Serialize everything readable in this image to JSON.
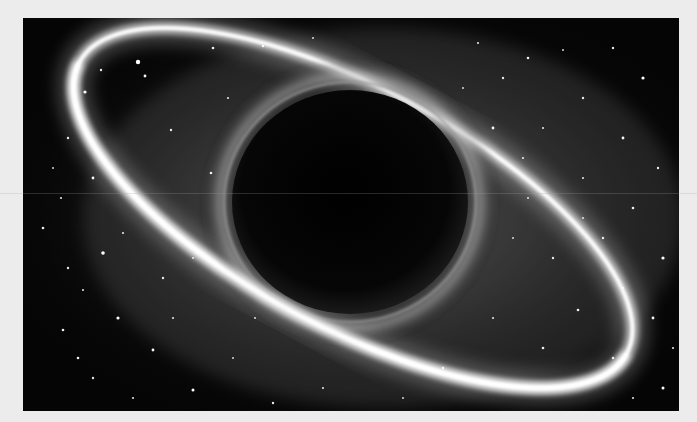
{
  "image": {
    "subject": "black hole with glowing accretion ring in a starfield",
    "palette": {
      "background_frame": "#ececec",
      "space": "#050505",
      "ring_glow": "#ffffff",
      "haze": "#9a9a9a",
      "event_horizon": "#000000"
    },
    "black_hole": {
      "cx": 327,
      "cy": 184,
      "rx": 118,
      "ry": 112
    },
    "stars": [
      [
        115,
        44,
        2.2
      ],
      [
        122,
        58,
        1.4
      ],
      [
        190,
        30,
        1.3
      ],
      [
        78,
        52,
        1.2
      ],
      [
        62,
        74,
        1.6
      ],
      [
        45,
        120,
        1.2
      ],
      [
        70,
        160,
        1.4
      ],
      [
        38,
        180,
        1.1
      ],
      [
        20,
        210,
        1.3
      ],
      [
        80,
        235,
        1.8
      ],
      [
        45,
        250,
        1.2
      ],
      [
        60,
        272,
        1.1
      ],
      [
        40,
        312,
        1.3
      ],
      [
        95,
        300,
        1.6
      ],
      [
        70,
        360,
        1.2
      ],
      [
        130,
        332,
        1.4
      ],
      [
        110,
        380,
        1.1
      ],
      [
        170,
        372,
        1.5
      ],
      [
        188,
        155,
        1.3
      ],
      [
        148,
        112,
        1.2
      ],
      [
        205,
        80,
        1.1
      ],
      [
        240,
        28,
        1.2
      ],
      [
        290,
        20,
        1.0
      ],
      [
        455,
        25,
        1.1
      ],
      [
        505,
        40,
        1.3
      ],
      [
        540,
        32,
        1.0
      ],
      [
        590,
        30,
        1.2
      ],
      [
        620,
        60,
        1.6
      ],
      [
        560,
        80,
        1.2
      ],
      [
        520,
        110,
        1.1
      ],
      [
        600,
        120,
        1.4
      ],
      [
        635,
        150,
        1.2
      ],
      [
        560,
        160,
        1.1
      ],
      [
        505,
        180,
        1.0
      ],
      [
        610,
        190,
        1.3
      ],
      [
        580,
        220,
        1.2
      ],
      [
        640,
        240,
        1.6
      ],
      [
        600,
        270,
        1.1
      ],
      [
        555,
        292,
        1.3
      ],
      [
        630,
        300,
        1.4
      ],
      [
        590,
        340,
        1.2
      ],
      [
        650,
        330,
        1.1
      ],
      [
        640,
        370,
        1.5
      ],
      [
        530,
        240,
        1.2
      ],
      [
        490,
        220,
        1.0
      ],
      [
        470,
        300,
        1.1
      ],
      [
        420,
        350,
        1.2
      ],
      [
        380,
        380,
        1.0
      ],
      [
        300,
        370,
        1.1
      ],
      [
        250,
        385,
        1.2
      ],
      [
        210,
        340,
        1.0
      ],
      [
        480,
        60,
        1.2
      ],
      [
        440,
        70,
        1.0
      ],
      [
        470,
        110,
        1.4
      ],
      [
        500,
        140,
        1.1
      ],
      [
        560,
        200,
        1.0
      ],
      [
        520,
        330,
        1.3
      ],
      [
        610,
        380,
        1.1
      ],
      [
        170,
        240,
        1.0
      ],
      [
        140,
        260,
        1.2
      ],
      [
        100,
        215,
        1.1
      ],
      [
        30,
        150,
        1.0
      ],
      [
        55,
        340,
        1.3
      ],
      [
        150,
        300,
        1.1
      ],
      [
        232,
        300,
        1.0
      ]
    ]
  }
}
